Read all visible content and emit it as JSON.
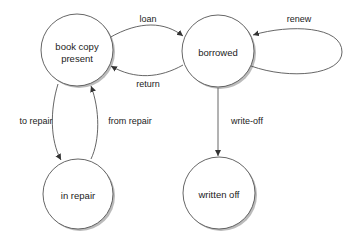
{
  "diagram": {
    "type": "state-diagram",
    "states": [
      {
        "id": "present",
        "label_line1": "book copy",
        "label_line2": "present"
      },
      {
        "id": "borrowed",
        "label": "borrowed"
      },
      {
        "id": "in_repair",
        "label": "in repair"
      },
      {
        "id": "written_off",
        "label": "written off"
      }
    ],
    "transitions": [
      {
        "from": "present",
        "to": "borrowed",
        "label": "loan"
      },
      {
        "from": "borrowed",
        "to": "present",
        "label": "return"
      },
      {
        "from": "borrowed",
        "to": "borrowed",
        "label": "renew"
      },
      {
        "from": "present",
        "to": "in_repair",
        "label": "to repair"
      },
      {
        "from": "in_repair",
        "to": "present",
        "label": "from repair"
      },
      {
        "from": "borrowed",
        "to": "written_off",
        "label": "write-off"
      }
    ],
    "colors": {
      "stroke": "#444444",
      "fill": "#ffffff",
      "shadow": "#bbbbbb",
      "text": "#222222"
    }
  }
}
